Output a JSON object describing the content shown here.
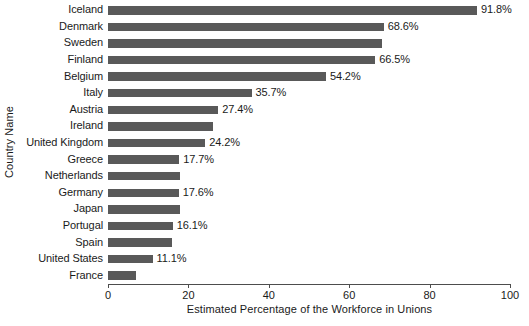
{
  "chart_data": {
    "type": "bar",
    "orientation": "horizontal",
    "title": "",
    "xlabel": "Estimated Percentage of the Workforce in Unions",
    "ylabel": "Country Name",
    "xlim": [
      0,
      100
    ],
    "xticks": [
      0,
      20,
      40,
      60,
      80,
      100
    ],
    "grid": false,
    "legend": null,
    "bar_color": "#595959",
    "categories": [
      "Iceland",
      "Denmark",
      "Sweden",
      "Finland",
      "Belgium",
      "Italy",
      "Austria",
      "Ireland",
      "United Kingdom",
      "Greece",
      "Netherlands",
      "Germany",
      "Japan",
      "Portugal",
      "Spain",
      "United States",
      "France"
    ],
    "values": [
      91.8,
      68.6,
      68.2,
      66.5,
      54.2,
      35.7,
      27.4,
      26.0,
      24.2,
      17.7,
      18.0,
      17.6,
      17.8,
      16.1,
      15.9,
      11.1,
      7.0
    ],
    "value_labels": [
      "91.8%",
      "68.6%",
      "",
      "66.5%",
      "54.2%",
      "35.7%",
      "27.4%",
      "",
      "24.2%",
      "17.7%",
      "",
      "17.6%",
      "",
      "16.1%",
      "",
      "11.1%",
      ""
    ]
  }
}
